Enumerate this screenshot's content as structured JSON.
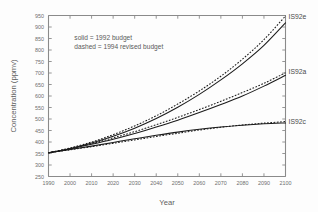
{
  "chart_data": {
    "type": "line",
    "title": "",
    "xlabel": "Year",
    "ylabel": "Concentration (ppmv)",
    "xlim": [
      1990,
      2100
    ],
    "ylim": [
      250,
      950
    ],
    "grid": false,
    "xticks": [
      1990,
      2000,
      2010,
      2020,
      2030,
      2040,
      2050,
      2060,
      2070,
      2080,
      2090,
      2100
    ],
    "yticks": [
      250,
      300,
      350,
      400,
      450,
      500,
      550,
      600,
      650,
      700,
      750,
      800,
      850,
      900,
      950
    ],
    "xticklabels": [
      "1990",
      "2000",
      "2010",
      "2020",
      "2030",
      "2040",
      "2050",
      "2060",
      "2070",
      "2080",
      "2090",
      "2100"
    ],
    "yticklabels": [
      "250",
      "300",
      "350",
      "400",
      "450",
      "500",
      "550",
      "600",
      "650",
      "700",
      "750",
      "800",
      "850",
      "900",
      "950"
    ],
    "annotations": [
      {
        "name": "legend-solid",
        "text": "solid = 1992 budget",
        "x": 2002,
        "y": 845
      },
      {
        "name": "legend-dashed",
        "text": "dashed = 1994 revised budget",
        "x": 2002,
        "y": 805
      }
    ],
    "curve_labels": [
      {
        "name": "IS92e",
        "text": "IS92e",
        "x": 2100,
        "y": 945
      },
      {
        "name": "IS92a",
        "text": "IS92a",
        "x": 2100,
        "y": 705
      },
      {
        "name": "IS92c",
        "text": "IS92c",
        "x": 2100,
        "y": 490
      }
    ],
    "x": [
      1990,
      2000,
      2010,
      2020,
      2030,
      2040,
      2050,
      2060,
      2070,
      2080,
      2090,
      2100
    ],
    "series": [
      {
        "name": "IS92e 1992 budget",
        "scenario": "IS92e",
        "style": "solid",
        "values": [
          353,
          372,
          396,
          425,
          460,
          502,
          551,
          607,
          670,
          740,
          820,
          918
        ]
      },
      {
        "name": "IS92e 1994 revised budget",
        "scenario": "IS92e",
        "style": "dashed",
        "values": [
          353,
          374,
          400,
          432,
          470,
          514,
          565,
          622,
          686,
          760,
          845,
          948
        ]
      },
      {
        "name": "IS92a 1992 budget",
        "scenario": "IS92a",
        "style": "solid",
        "values": [
          353,
          370,
          390,
          412,
          437,
          465,
          495,
          528,
          563,
          600,
          643,
          690
        ]
      },
      {
        "name": "IS92a 1994 revised budget",
        "scenario": "IS92a",
        "style": "dashed",
        "values": [
          353,
          371,
          393,
          418,
          445,
          475,
          507,
          541,
          577,
          615,
          655,
          701
        ]
      },
      {
        "name": "IS92c 1992 budget",
        "scenario": "IS92c",
        "style": "solid",
        "values": [
          353,
          367,
          382,
          398,
          414,
          429,
          443,
          455,
          465,
          473,
          479,
          483
        ]
      },
      {
        "name": "IS92c 1994 revised budget",
        "scenario": "IS92c",
        "style": "dashed",
        "values": [
          353,
          366,
          380,
          394,
          409,
          424,
          438,
          452,
          464,
          474,
          482,
          489
        ]
      }
    ]
  },
  "colors": {
    "curve": "#1b1b1b",
    "axis": "#8a8a8a",
    "text": "#5a5a5a",
    "background": "#fdfdfd"
  }
}
